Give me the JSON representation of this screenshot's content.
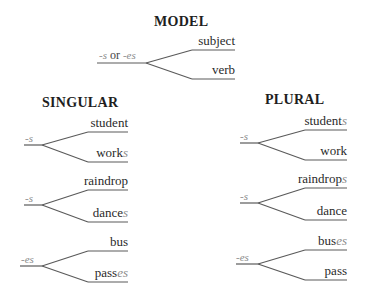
{
  "model": {
    "title": "MODEL",
    "stem_prefix": "-s",
    "stem_or": " or ",
    "stem_suffix": "-es",
    "upper": "subject",
    "lower": "verb"
  },
  "singular": {
    "title": "SINGULAR",
    "groups": [
      {
        "stem": "-s",
        "upper_base": "student",
        "upper_suffix": "",
        "lower_base": "work",
        "lower_suffix": "s"
      },
      {
        "stem": "-s",
        "upper_base": "raindrop",
        "upper_suffix": "",
        "lower_base": "dance",
        "lower_suffix": "s"
      },
      {
        "stem": "-es",
        "upper_base": "bus",
        "upper_suffix": "",
        "lower_base": "pass",
        "lower_suffix": "es"
      }
    ]
  },
  "plural": {
    "title": "PLURAL",
    "groups": [
      {
        "stem": "-s",
        "upper_base": "student",
        "upper_suffix": "s",
        "lower_base": "work",
        "lower_suffix": ""
      },
      {
        "stem": "-s",
        "upper_base": "raindrop",
        "upper_suffix": "s",
        "lower_base": "dance",
        "lower_suffix": ""
      },
      {
        "stem": "-es",
        "upper_base": "bus",
        "upper_suffix": "es",
        "lower_base": "pass",
        "lower_suffix": ""
      }
    ]
  },
  "colors": {
    "line": "#5a5a5a",
    "text": "#2a2a2a",
    "suffix": "#8a8a8a"
  }
}
